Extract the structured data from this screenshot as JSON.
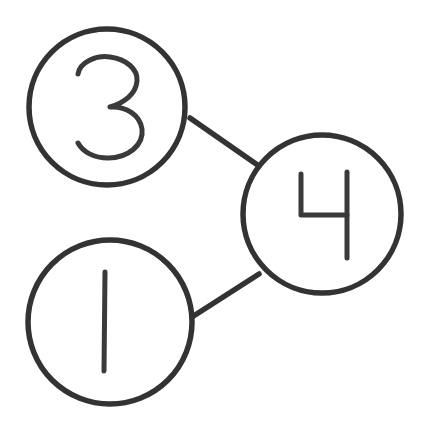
{
  "diagram": {
    "background_color": "#ffffff",
    "stroke_color": "#333333",
    "glyph_color": "#3a3a3a",
    "node_stroke_width": 5.5,
    "edge_stroke_width": 5.5,
    "glyph_stroke_width": 5.0,
    "canvas": {
      "width": 436,
      "height": 436
    },
    "nodes": [
      {
        "id": "node-3",
        "label": "3",
        "cx": 107,
        "cy": 107,
        "r": 78,
        "label_style": "handwritten"
      },
      {
        "id": "node-4",
        "label": "4",
        "cx": 322,
        "cy": 214,
        "r": 79,
        "label_style": "handwritten"
      },
      {
        "id": "node-1",
        "label": "1",
        "cx": 110,
        "cy": 322,
        "r": 82,
        "label_style": "handwritten"
      }
    ],
    "edges": [
      {
        "id": "edge-3-4",
        "from": "node-3",
        "to": "node-4",
        "x1": 190,
        "y1": 118,
        "x2": 259,
        "y2": 166
      },
      {
        "id": "edge-1-4",
        "from": "node-1",
        "to": "node-4",
        "x1": 192,
        "y1": 317,
        "x2": 259,
        "y2": 274
      }
    ]
  }
}
